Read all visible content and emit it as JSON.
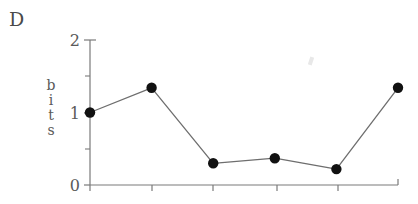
{
  "panel": {
    "label": "D"
  },
  "axes": {
    "ylabel": "bits",
    "ylabel_letters": [
      "b",
      "i",
      "t",
      "s"
    ],
    "ytick_labels": [
      "0",
      "1",
      "2"
    ],
    "ytick_values": [
      0,
      1,
      2
    ],
    "yminor_values": [
      0.5,
      1.5
    ],
    "xtick_count": 6,
    "xtick_labels": [
      "",
      "",
      "",
      "",
      "",
      ""
    ],
    "axis_color": "#7a7a7a"
  },
  "style": {
    "line_color": "#6e6e6e",
    "marker_color": "#111111",
    "text_color": "#5a5a5a",
    "background": "#ffffff"
  },
  "chart_data": {
    "type": "line",
    "title": "D",
    "xlabel": "",
    "ylabel": "bits",
    "ylim": [
      0,
      2
    ],
    "yticks": [
      0,
      1,
      2
    ],
    "yminor_ticks": [
      0.5,
      1.5
    ],
    "grid": false,
    "legend": null,
    "x": [
      1,
      2,
      3,
      4,
      5,
      6
    ],
    "xticklabels": [
      "",
      "",
      "",
      "",
      "",
      ""
    ],
    "values": [
      1.0,
      1.34,
      0.3,
      0.37,
      0.22,
      1.34
    ],
    "markers": "filled-circle",
    "series": [
      {
        "name": "bits",
        "values": [
          1.0,
          1.34,
          0.3,
          0.37,
          0.22,
          1.34
        ]
      }
    ]
  }
}
